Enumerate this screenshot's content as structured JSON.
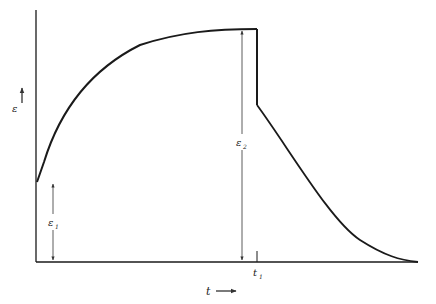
{
  "diagram": {
    "type": "creep-recovery strain-time curve",
    "y_axis_label": "ε",
    "x_axis_label": "t",
    "markers": {
      "t1": "t",
      "t1_sub": "1",
      "eps1": "ε",
      "eps1_sub": "1",
      "eps2": "ε",
      "eps2_sub": "2"
    },
    "colors": {
      "line": "#1a1a1a",
      "arrow": "#333333",
      "background": "#ffffff"
    }
  }
}
